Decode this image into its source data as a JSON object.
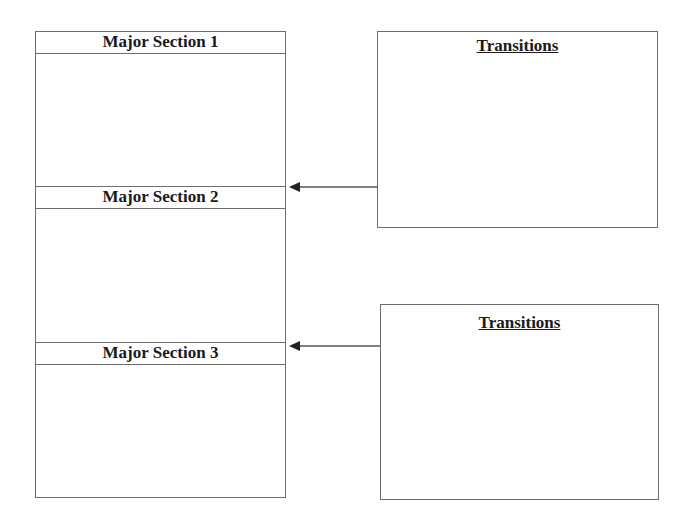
{
  "sections": [
    {
      "label": "Major Section 1"
    },
    {
      "label": "Major Section 2"
    },
    {
      "label": "Major Section 3"
    }
  ],
  "transitions": [
    {
      "title": "Transitions"
    },
    {
      "title": "Transitions"
    }
  ],
  "colors": {
    "line": "#6e6e6e",
    "text": "#1a1a1a",
    "arrow": "#222222"
  }
}
